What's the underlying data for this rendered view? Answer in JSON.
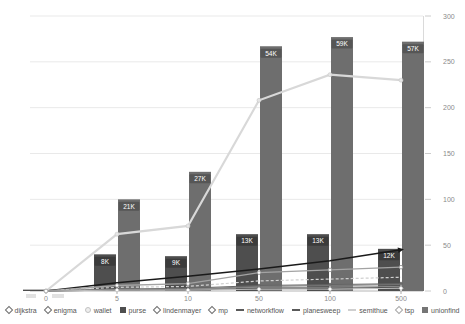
{
  "chart_data": {
    "type": "bar-line-combo",
    "title": "",
    "categories": [
      "0",
      "5",
      "10",
      "50",
      "100",
      "500"
    ],
    "x_axis": {
      "ticks": [
        "0",
        "5",
        "10",
        "50",
        "100",
        "500"
      ]
    },
    "y_axis": {
      "position": "right",
      "range": [
        0,
        300
      ],
      "ticks": [
        300,
        250,
        200,
        150,
        100,
        50,
        0
      ],
      "grid": true
    },
    "bar_series": [
      {
        "name": "purse",
        "color": "#4e4e4e",
        "chip_color": "#3b3b3b",
        "labels": [
          "",
          "8K",
          "9K",
          "13K",
          "13K",
          "12K"
        ],
        "values_k": [
          0,
          8,
          9,
          13,
          13,
          12
        ],
        "heights_axis_units": [
          1.5,
          40,
          38,
          62,
          62,
          46
        ]
      },
      {
        "name": "unionfind",
        "color": "#6e6e6e",
        "chip_color": "#565656",
        "labels": [
          "",
          "21K",
          "27K",
          "54K",
          "59K",
          "57K"
        ],
        "values_k": [
          0,
          21,
          27,
          54,
          59,
          57
        ],
        "heights_axis_units": [
          1.5,
          100,
          130,
          267,
          277,
          272
        ]
      }
    ],
    "line_series": [
      {
        "name": "wallet",
        "color": "#d8d8d8",
        "width": 2.2,
        "dash": "",
        "marker": "circle-light",
        "arrow": false,
        "values": [
          0,
          62,
          71,
          208,
          236,
          230
        ]
      },
      {
        "name": "networkflow",
        "color": "#1a1a1a",
        "width": 1.5,
        "dash": "",
        "marker": "none",
        "arrow": true,
        "values": [
          0,
          9,
          16,
          24,
          33,
          45
        ]
      },
      {
        "name": "planesweep",
        "color": "#a3a3a3",
        "width": 1.3,
        "dash": "",
        "marker": "circle-open",
        "arrow": false,
        "values": [
          0,
          6,
          8,
          20,
          23,
          26
        ]
      },
      {
        "name": "semithue",
        "color": "#d0d0d0",
        "width": 1.2,
        "dash": "3,2",
        "marker": "none",
        "arrow": false,
        "values": [
          0,
          4,
          5,
          11,
          13,
          15
        ]
      },
      {
        "name": "dijkstra",
        "color": "#646464",
        "width": 1,
        "dash": "",
        "marker": "diamond",
        "arrow": false,
        "values": [
          0,
          2,
          3,
          6,
          7,
          8
        ]
      },
      {
        "name": "enigma",
        "color": "#787878",
        "width": 1,
        "dash": "",
        "marker": "dot",
        "arrow": false,
        "values": [
          0,
          2,
          2,
          5,
          6,
          7
        ]
      },
      {
        "name": "lindenmayer",
        "color": "#8e8e8e",
        "width": 1,
        "dash": "",
        "marker": "dot",
        "arrow": false,
        "values": [
          0,
          1,
          2,
          4,
          4,
          5
        ]
      },
      {
        "name": "mp",
        "color": "#555555",
        "width": 1,
        "dash": "",
        "marker": "dot",
        "arrow": false,
        "values": [
          0,
          1,
          1,
          3,
          3,
          4
        ]
      },
      {
        "name": "tsp",
        "color": "#bdbdbd",
        "width": 1,
        "dash": "",
        "marker": "diamond-open",
        "arrow": false,
        "values": [
          0,
          1,
          1,
          2,
          2,
          3
        ]
      }
    ]
  },
  "legend": {
    "items": [
      {
        "label": "dijkstra",
        "marker": "diamond"
      },
      {
        "label": "enigma",
        "marker": "diamond"
      },
      {
        "label": "wallet",
        "marker": "circle"
      },
      {
        "label": "purse",
        "marker": "square-dark"
      },
      {
        "label": "lindenmayer",
        "marker": "diamond"
      },
      {
        "label": "mp",
        "marker": "diamond"
      },
      {
        "label": "networkflow",
        "marker": "dash"
      },
      {
        "label": "planesweep",
        "marker": "dash"
      },
      {
        "label": "semithue",
        "marker": "dash-light"
      },
      {
        "label": "tsp",
        "marker": "diamond-open"
      },
      {
        "label": "unionfind",
        "marker": "square-gray"
      }
    ]
  },
  "colors": {
    "background": "#ffffff",
    "gridline": "#e9e9e9",
    "axis_line": "#b5b5b5",
    "tick_label": "#8a8a8a",
    "chip_text": "#ffffff"
  }
}
